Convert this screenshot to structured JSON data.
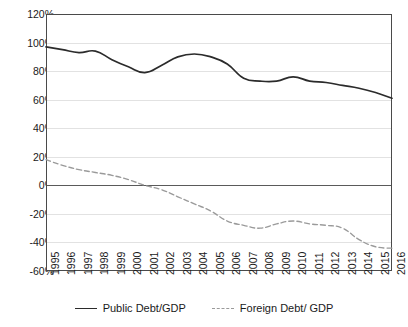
{
  "chart_data": {
    "type": "line",
    "title": "",
    "xlabel": "",
    "ylabel": "",
    "ylim": [
      -60,
      120
    ],
    "ytick_values": [
      120,
      100,
      80,
      60,
      40,
      20,
      0,
      -20,
      -40,
      -60
    ],
    "ytick_labels": [
      "120%",
      "100%",
      "80%",
      "60%",
      "40%",
      "20%",
      "0%",
      "-20%",
      "-40%",
      "-60%"
    ],
    "grid": true,
    "legend_position": "bottom",
    "categories": [
      1995,
      1996,
      1997,
      1998,
      1999,
      2000,
      2001,
      2002,
      2003,
      2004,
      2005,
      2006,
      2007,
      2008,
      2009,
      2010,
      2011,
      2012,
      2013,
      2014,
      2015,
      2016
    ],
    "xtick_labels": [
      "1995",
      "1996",
      "1997",
      "1998",
      "1999",
      "2000",
      "2001",
      "2002",
      "2003",
      "2004",
      "2005",
      "2006",
      "2007",
      "2008",
      "2009",
      "2010",
      "2011",
      "2012",
      "2013",
      "2014",
      "2015",
      "2016"
    ],
    "series": [
      {
        "name": "Public Debt/GDP",
        "style": "solid",
        "color": "#2b2b2b",
        "values": [
          97,
          95,
          93,
          94,
          88,
          83,
          79,
          84,
          90,
          92,
          90,
          85,
          75,
          73,
          73,
          76,
          73,
          72,
          70,
          68,
          65,
          61
        ]
      },
      {
        "name": "Foreign Debt/ GDP",
        "style": "dashed",
        "color": "#9a9a9a",
        "values": [
          18,
          14,
          11,
          9,
          7,
          4,
          0,
          -3,
          -8,
          -13,
          -18,
          -25,
          -28,
          -30,
          -27,
          -25,
          -27,
          -28,
          -30,
          -38,
          -43,
          -44
        ]
      }
    ]
  },
  "legend": {
    "items": [
      {
        "label": "Public Debt/GDP",
        "style": "solid"
      },
      {
        "label": "Foreign Debt/ GDP",
        "style": "dashed"
      }
    ]
  }
}
